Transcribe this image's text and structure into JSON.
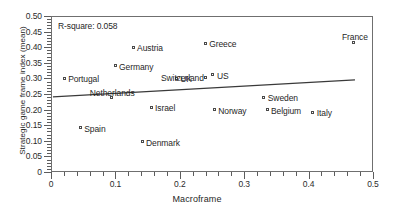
{
  "chart_data": {
    "type": "scatter",
    "title": "",
    "xlabel": "Macroframe",
    "ylabel": "Strategic game frame index (mean)",
    "xlim": [
      0,
      0.5
    ],
    "ylim": [
      0,
      0.5
    ],
    "grid": false,
    "legend": "none",
    "annotation": "R-square: 0.058",
    "xticks": [
      "0",
      "0.1",
      "0.2",
      "0.3",
      "0.4",
      "0.5"
    ],
    "xtick_values": [
      0,
      0.1,
      0.2,
      0.3,
      0.4,
      0.5
    ],
    "yticks": [
      "0",
      "0.05",
      "0.10",
      "0.15",
      "0.20",
      "0.25",
      "0.30",
      "0.35",
      "0.40",
      "0.45",
      "0.50"
    ],
    "ytick_values": [
      0,
      0.05,
      0.1,
      0.15,
      0.2,
      0.25,
      0.3,
      0.35,
      0.4,
      0.45,
      0.5
    ],
    "points": [
      {
        "label": "Portugal",
        "x": 0.022,
        "y": 0.298,
        "label_pos": "right"
      },
      {
        "label": "Germany",
        "x": 0.101,
        "y": 0.337,
        "label_pos": "right"
      },
      {
        "label": "Austria",
        "x": 0.129,
        "y": 0.397,
        "label_pos": "right"
      },
      {
        "label": "Greece",
        "x": 0.241,
        "y": 0.41,
        "label_pos": "right"
      },
      {
        "label": "France",
        "x": 0.472,
        "y": 0.413,
        "label_pos": "above"
      },
      {
        "label": "UK",
        "x": 0.196,
        "y": 0.298,
        "label_pos": "right"
      },
      {
        "label": "Switzerland",
        "x": 0.242,
        "y": 0.301,
        "label_pos": "left"
      },
      {
        "label": "US",
        "x": 0.253,
        "y": 0.308,
        "label_pos": "right"
      },
      {
        "label": "Netherlands",
        "x": 0.095,
        "y": 0.234,
        "label_pos": "above"
      },
      {
        "label": "Sweden",
        "x": 0.332,
        "y": 0.237,
        "label_pos": "right"
      },
      {
        "label": "Israel",
        "x": 0.157,
        "y": 0.205,
        "label_pos": "right"
      },
      {
        "label": "Norway",
        "x": 0.255,
        "y": 0.196,
        "label_pos": "right"
      },
      {
        "label": "Belgium",
        "x": 0.337,
        "y": 0.196,
        "label_pos": "right"
      },
      {
        "label": "Italy",
        "x": 0.408,
        "y": 0.189,
        "label_pos": "right"
      },
      {
        "label": "Spain",
        "x": 0.047,
        "y": 0.138,
        "label_pos": "right"
      },
      {
        "label": "Denmark",
        "x": 0.143,
        "y": 0.093,
        "label_pos": "right"
      }
    ],
    "fit_line": {
      "x0": 0.003,
      "y0": 0.241,
      "x1": 0.472,
      "y1": 0.295
    },
    "colors": {
      "marker_edge": "#4a4a4a",
      "marker_fill": "#ffffff",
      "line": "#3a3a3a",
      "axis": "#6f6f6f",
      "text": "#1f1f1f"
    }
  }
}
